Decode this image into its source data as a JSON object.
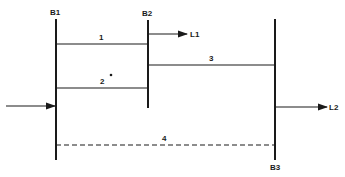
{
  "diagram": {
    "type": "power-system-one-line",
    "colors": {
      "line": "#1a1a1a",
      "background": "#ffffff"
    },
    "buses": [
      {
        "id": "B1",
        "label": "B1"
      },
      {
        "id": "B2",
        "label": "B2"
      },
      {
        "id": "B3",
        "label": "B3"
      }
    ],
    "lines": [
      {
        "id": "1",
        "label": "1",
        "from": "B1",
        "to": "B2",
        "style": "solid"
      },
      {
        "id": "2",
        "label": "2",
        "from": "B1",
        "to": "B2",
        "style": "solid",
        "marker": "•"
      },
      {
        "id": "3",
        "label": "3",
        "from": "B2",
        "to": "B3",
        "style": "solid"
      },
      {
        "id": "4",
        "label": "4",
        "from": "B1",
        "to": "B3",
        "style": "dashed"
      }
    ],
    "loads": [
      {
        "id": "L1",
        "label": "L1",
        "bus": "B2"
      },
      {
        "id": "L2",
        "label": "L2",
        "bus": "B3"
      }
    ],
    "source": {
      "bus": "B1",
      "label": ""
    }
  }
}
